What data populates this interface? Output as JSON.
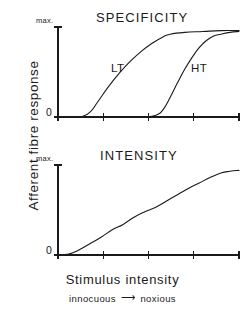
{
  "figure": {
    "y_axis_label": "Afferent fibre response",
    "x_axis_label": "Stimulus intensity",
    "x_axis_sublabel_left": "innocuous",
    "x_axis_sublabel_right": "noxious",
    "arrow_glyph": "⟶",
    "line_color": "#1a1a1a",
    "background_color": "#ffffff"
  },
  "chart_data": [
    {
      "type": "line",
      "title": "SPECIFICITY",
      "xlabel": "Stimulus intensity",
      "ylabel": "Afferent fibre response",
      "xlim": [
        0,
        100
      ],
      "ylim": [
        0,
        100
      ],
      "ytick_labels": [
        "0",
        "max."
      ],
      "ytick_values": [
        0,
        100
      ],
      "xtick_values": [
        0,
        25,
        50,
        75,
        100
      ],
      "grid": false,
      "legend": "inline-annotations",
      "series": [
        {
          "name": "LT",
          "label_position": {
            "x": 30,
            "y": 52
          },
          "x": [
            0,
            10,
            14,
            18,
            22,
            28,
            34,
            40,
            46,
            52,
            58,
            62,
            70,
            80,
            90,
            100
          ],
          "y": [
            0,
            0,
            1,
            6,
            17,
            34,
            49,
            62,
            73,
            82,
            89,
            92,
            94,
            95,
            96,
            96
          ]
        },
        {
          "name": "HT",
          "label_position": {
            "x": 73,
            "y": 52
          },
          "x": [
            0,
            40,
            48,
            54,
            58,
            62,
            66,
            70,
            74,
            78,
            82,
            86,
            90,
            95,
            100
          ],
          "y": [
            0,
            0,
            0,
            2,
            8,
            22,
            38,
            53,
            66,
            77,
            85,
            90,
            92,
            94,
            95
          ]
        }
      ]
    },
    {
      "type": "line",
      "title": "INTENSITY",
      "xlabel": "Stimulus intensity",
      "ylabel": "Afferent fibre response",
      "xlim": [
        0,
        100
      ],
      "ylim": [
        0,
        100
      ],
      "ytick_labels": [
        "0",
        "max."
      ],
      "ytick_values": [
        0,
        100
      ],
      "xtick_values": [
        0,
        25,
        50,
        75,
        100
      ],
      "grid": false,
      "series": [
        {
          "name": "Intensity response",
          "x": [
            0,
            6,
            12,
            18,
            24,
            30,
            36,
            42,
            48,
            54,
            60,
            66,
            72,
            78,
            84,
            90,
            95,
            100
          ],
          "y": [
            0,
            1,
            6,
            13,
            20,
            28,
            34,
            42,
            48,
            53,
            60,
            67,
            74,
            80,
            86,
            91,
            93,
            94
          ]
        }
      ]
    }
  ]
}
